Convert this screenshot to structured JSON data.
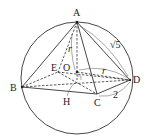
{
  "diagram": {
    "type": "sphere circumscribing square pyramid",
    "labels": {
      "A": "A",
      "B": "B",
      "C": "C",
      "D": "D",
      "E": "E",
      "O": "O",
      "H": "H",
      "r_vertical": "r",
      "r_horizontal": "r",
      "edge_AD": "√5",
      "edge_CD": "2"
    },
    "points": {
      "A": [
        77,
        22
      ],
      "B": [
        22,
        87
      ],
      "C": [
        97,
        94
      ],
      "D": [
        130,
        80
      ],
      "E": [
        58,
        72
      ],
      "O": [
        77,
        72
      ],
      "H": [
        77,
        80
      ]
    },
    "circle": {
      "cx": 77,
      "cy": 80,
      "r": 56
    }
  }
}
